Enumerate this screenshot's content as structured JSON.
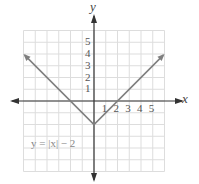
{
  "chart_data": {
    "type": "line",
    "title": "",
    "xlabel": "x",
    "ylabel": "y",
    "xlim": [
      -6,
      6
    ],
    "ylim": [
      -6,
      6
    ],
    "grid": true,
    "x_tick_labels": [
      "1",
      "2",
      "3",
      "4",
      "5"
    ],
    "y_tick_labels": [
      "1",
      "2",
      "3",
      "4",
      "5"
    ],
    "series": [
      {
        "name": "y = |x| − 2",
        "x": [
          -6,
          -2,
          0,
          2,
          6
        ],
        "values": [
          4,
          0,
          -2,
          0,
          4
        ]
      }
    ],
    "annotations": [
      {
        "text": "y = |x| − 2",
        "x": -5,
        "y": -3.5
      }
    ]
  },
  "labels": {
    "x_axis": "x",
    "y_axis": "y",
    "equation": "y = |x| − 2"
  },
  "colors": {
    "curve": "#7f7f7f",
    "axis": "#333333",
    "grid": "#dddddd"
  }
}
